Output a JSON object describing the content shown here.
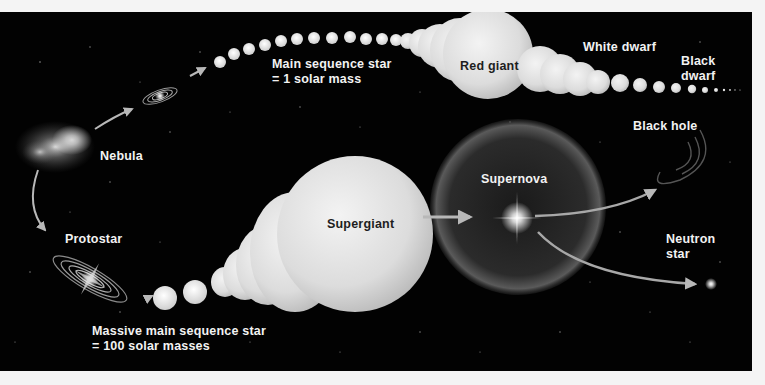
{
  "diagram": {
    "colors": {
      "background": "#f4f4f4",
      "space": "#020202",
      "star_fill": "#e4e4e4",
      "label_light": "#f2f2f2",
      "label_dark": "#1e1e1e",
      "arrow": "#b8b8b8"
    },
    "labels": {
      "nebula": "Nebula",
      "protostar": "Protostar",
      "main_sequence_line1": "Main sequence star",
      "main_sequence_line2": "= 1 solar mass",
      "red_giant": "Red giant",
      "white_dwarf": "White dwarf",
      "black_dwarf_line1": "Black",
      "black_dwarf_line2": "dwarf",
      "massive_line1": "Massive main sequence star",
      "massive_line2": "= 100 solar masses",
      "supergiant": "Supergiant",
      "supernova": "Supernova",
      "black_hole": "Black hole",
      "neutron_line1": "Neutron",
      "neutron_line2": "star"
    },
    "stages": [
      {
        "id": "nebula",
        "path": "both"
      },
      {
        "id": "protostar",
        "path": "both"
      },
      {
        "id": "main-sequence-star",
        "path": "low-mass",
        "mass": "1 solar mass"
      },
      {
        "id": "red-giant",
        "path": "low-mass"
      },
      {
        "id": "white-dwarf",
        "path": "low-mass"
      },
      {
        "id": "black-dwarf",
        "path": "low-mass"
      },
      {
        "id": "massive-main-sequence-star",
        "path": "high-mass",
        "mass": "100 solar masses"
      },
      {
        "id": "supergiant",
        "path": "high-mass"
      },
      {
        "id": "supernova",
        "path": "high-mass"
      },
      {
        "id": "black-hole",
        "path": "high-mass"
      },
      {
        "id": "neutron-star",
        "path": "high-mass"
      }
    ]
  }
}
